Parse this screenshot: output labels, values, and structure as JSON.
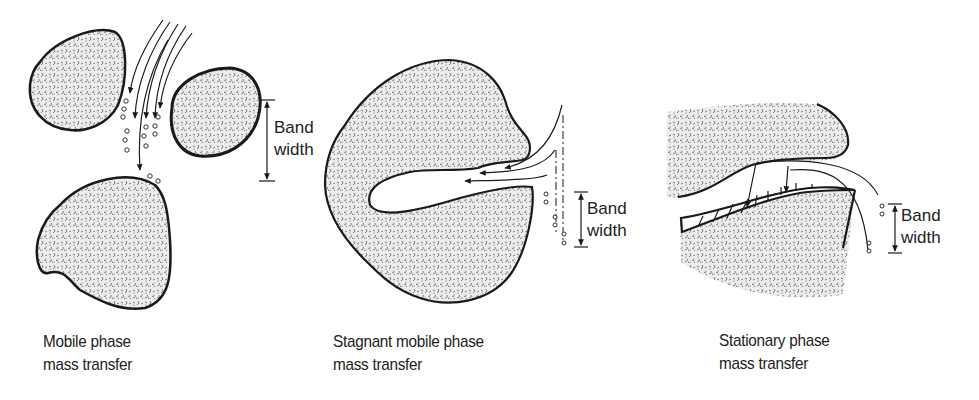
{
  "panels": [
    {
      "id": "mobile",
      "caption_line1": "Mobile phase",
      "caption_line2": "mass transfer",
      "band_label_line1": "Band",
      "band_label_line2": "width"
    },
    {
      "id": "stagnant",
      "caption_line1": "Stagnant mobile phase",
      "caption_line2": "mass transfer",
      "band_label_line1": "Band",
      "band_label_line2": "width"
    },
    {
      "id": "stationary",
      "caption_line1": "Stationary phase",
      "caption_line2": "mass transfer",
      "band_label_line1": "Band",
      "band_label_line2": "width"
    }
  ],
  "colors": {
    "outline": "#1a1a1a",
    "particle_fill": "#e6e6e6",
    "text": "#222222",
    "background": "#ffffff"
  }
}
